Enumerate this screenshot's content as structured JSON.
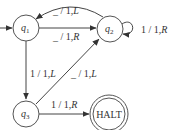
{
  "diagram": {
    "type": "state-machine",
    "states": [
      {
        "id": "q1",
        "label": "q",
        "sub": "1",
        "start": true
      },
      {
        "id": "q2",
        "label": "q",
        "sub": "2"
      },
      {
        "id": "q3",
        "label": "q",
        "sub": "3"
      },
      {
        "id": "halt",
        "label": "HALT",
        "accepting": true
      }
    ],
    "transitions": [
      {
        "from": "q2",
        "to": "q1",
        "label": "␣ / 1, L",
        "read": "_",
        "write": "1",
        "move": "L"
      },
      {
        "from": "q1",
        "to": "q2",
        "label": "␣ / 1, R",
        "read": "_",
        "write": "1",
        "move": "R"
      },
      {
        "from": "q2",
        "to": "q2",
        "label": "1 / 1, R",
        "read": "1",
        "write": "1",
        "move": "R"
      },
      {
        "from": "q1",
        "to": "q3",
        "label": "1 / 1, L",
        "read": "1",
        "write": "1",
        "move": "L"
      },
      {
        "from": "q3",
        "to": "q2",
        "label": "␣ / 1, L",
        "read": "_",
        "write": "1",
        "move": "L"
      },
      {
        "from": "q3",
        "to": "halt",
        "label": "1 / 1, R",
        "read": "1",
        "write": "1",
        "move": "R"
      }
    ]
  },
  "labels": {
    "q2q1": {
      "read": "_",
      "rest": " / 1,",
      "move": "L"
    },
    "q1q2": {
      "read": "_",
      "rest": " / 1,",
      "move": "R"
    },
    "q2q2": {
      "read": "1",
      "rest": " / 1,",
      "move": "R"
    },
    "q1q3": {
      "read": "1",
      "rest": " / 1,",
      "move": "L"
    },
    "q3q2": {
      "read": "_",
      "rest": " / 1,",
      "move": "L"
    },
    "q3halt": {
      "read": "1",
      "rest": " / 1,",
      "move": "R"
    }
  }
}
